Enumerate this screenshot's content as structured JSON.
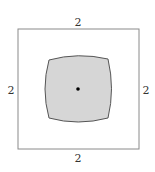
{
  "diagram": {
    "outer_square": {
      "stroke": "#8a8a8a",
      "labels": {
        "top": "2",
        "left": "2",
        "right": "2",
        "bottom": "2"
      }
    },
    "inner_shape": {
      "fill": "#d6d6d6",
      "stroke": "#555555"
    },
    "center_point": {
      "color": "#000000"
    }
  }
}
